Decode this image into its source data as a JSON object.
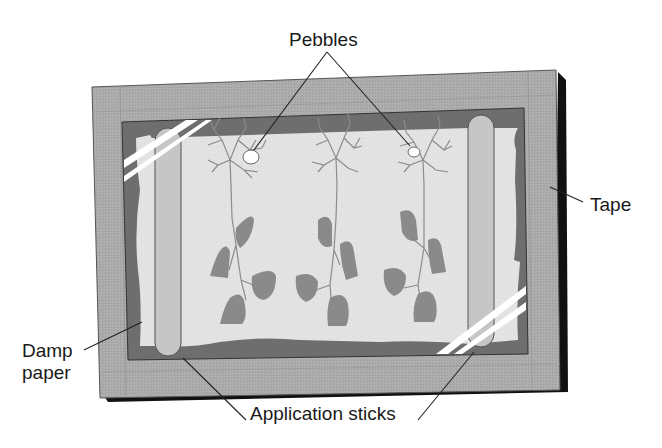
{
  "diagram": {
    "labels": {
      "pebbles": "Pebbles",
      "tape": "Tape",
      "damp_paper_line1": "Damp",
      "damp_paper_line2": "paper",
      "application_sticks": "Application sticks"
    },
    "components": [
      {
        "id": "frame",
        "name": "Frame with tape border"
      },
      {
        "id": "damp-paper",
        "name": "Damp paper"
      },
      {
        "id": "application-stick-left",
        "name": "Application stick (left)"
      },
      {
        "id": "application-stick-right",
        "name": "Application stick (right)"
      },
      {
        "id": "plant-1",
        "name": "Plant specimen 1",
        "has_pebble": true
      },
      {
        "id": "plant-2",
        "name": "Plant specimen 2",
        "has_pebble": false
      },
      {
        "id": "plant-3",
        "name": "Plant specimen 3",
        "has_pebble": true
      },
      {
        "id": "tape-strip-top-left",
        "name": "Tape strip top-left"
      },
      {
        "id": "tape-strip-bottom-right",
        "name": "Tape strip bottom-right"
      }
    ],
    "colors": {
      "background": "#ffffff",
      "frame_border": "#a9a9a9",
      "frame_shadow": "#111111",
      "inner_dark": "#6e6e6e",
      "paper": "#e4e4e4",
      "stick": "#c4c4c4",
      "leaf": "#8a8a8a",
      "stem": "#8c8c8c",
      "leader_line": "#222222",
      "text": "#1a1a1a"
    }
  }
}
